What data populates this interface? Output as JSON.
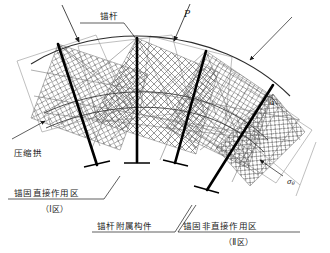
{
  "figure": {
    "type": "engineering-diagram",
    "bolt_count": 4
  },
  "labels": {
    "bolt": "锚杆",
    "load": "P",
    "compression_arch": "压缩拱",
    "zone1_name": "锚固直接作用区",
    "zone1_tag": "（Ⅰ区）",
    "accessory": "锚杆附属构件",
    "zone2_name": "锚固非直接作用区",
    "zone2_tag": "（Ⅱ区）",
    "stress_sigma": "σ",
    "stress_sigma_sub": "θ",
    "angle": "α"
  },
  "icons": {
    "load_arrow": "down-arrow-icon",
    "leader_arrow": "leader-arrow-icon",
    "bolt_plate": "cross-mark-icon"
  },
  "colors": {
    "ink": "#1a1a1a",
    "bolt": "#000000",
    "hatch": "#555555",
    "thin": "#7a7a7a",
    "background": "#ffffff"
  }
}
